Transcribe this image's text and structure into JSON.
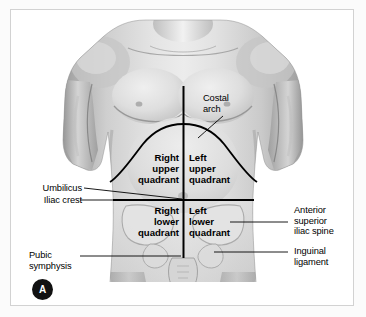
{
  "figure": {
    "panel_letter": "A",
    "title_alt": "Anterior view of the abdomen divided into four quadrants"
  },
  "quadrants": [
    {
      "id": "right-upper",
      "label": "Right\nupper\nquadrant"
    },
    {
      "id": "left-upper",
      "label": "Left\nupper\nquadrant"
    },
    {
      "id": "right-lower",
      "label": "Right\nlower\nquadrant"
    },
    {
      "id": "left-lower",
      "label": "Left\nlower\nquadrant"
    }
  ],
  "landmarks": {
    "costal_arch": "Costal\narch",
    "umbilicus": "Umbilicus",
    "iliac_crest": "Iliac crest",
    "pubic_symphysis": "Pubic\nsymphysis",
    "anterior_superior_iliac_spine": "Anterior\nsuperior\niliac spine",
    "inguinal_ligament": "Inguinal\nligament"
  },
  "colors": {
    "line": "#000000",
    "text": "#000000",
    "frame": "#d2d2d2",
    "page_background": "#fbfbfb",
    "figure_background": "#ffffff",
    "badge_background": "#111111",
    "badge_text": "#ffffff",
    "skin_light": "#e9e9e9",
    "skin_mid": "#c8c8c8",
    "skin_shadow": "#9a9a9a",
    "skin_dark": "#7e7e7e"
  }
}
